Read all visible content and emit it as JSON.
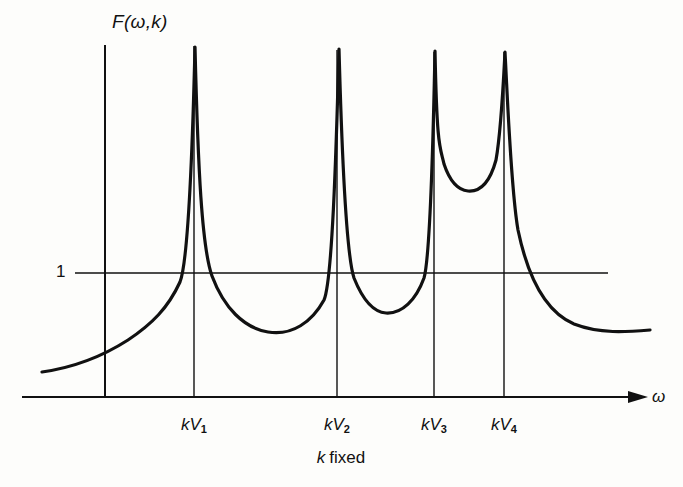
{
  "figure": {
    "y_axis_label": "F(ω,k)",
    "x_axis_label": "ω",
    "reference_label": "1",
    "caption_symbol": "k",
    "caption_text": "fixed",
    "caption_full": "k fixed",
    "ticks": [
      {
        "prefix": "kV",
        "index": "1"
      },
      {
        "prefix": "kV",
        "index": "2"
      },
      {
        "prefix": "kV",
        "index": "3"
      },
      {
        "prefix": "kV",
        "index": "4"
      }
    ],
    "ink_color": "#111111",
    "background_color": "#fdfdfb"
  },
  "chart_data": {
    "type": "line",
    "title": "",
    "subtitle": "k fixed",
    "xlabel": "ω",
    "ylabel": "F(ω,k)",
    "xlim": [
      0,
      683
    ],
    "ylim": [
      0,
      1
    ],
    "grid": false,
    "legend": null,
    "annotations": [
      {
        "text": "1",
        "type": "reference-level",
        "y_value": 1
      },
      {
        "text": "k fixed",
        "type": "caption"
      }
    ],
    "reference_lines": [
      {
        "orientation": "horizontal",
        "label": "1",
        "y_px": 273,
        "x_start_px": 75,
        "x_end_px": 608
      },
      {
        "orientation": "vertical",
        "label": "kV1",
        "x_px": 194,
        "y_top_px": 46,
        "y_bottom_px": 397
      },
      {
        "orientation": "vertical",
        "label": "kV2",
        "x_px": 337,
        "y_top_px": 50,
        "y_bottom_px": 397
      },
      {
        "orientation": "vertical",
        "label": "kV3",
        "x_px": 434,
        "y_top_px": 52,
        "y_bottom_px": 397
      },
      {
        "orientation": "vertical",
        "label": "kV4",
        "x_px": 504,
        "y_top_px": 52,
        "y_bottom_px": 397
      }
    ],
    "resonances": [
      {
        "label": "kV1",
        "x_px": 196,
        "peak_top_px": 46
      },
      {
        "label": "kV2",
        "x_px": 340,
        "peak_top_px": 50
      },
      {
        "label": "kV3",
        "x_px": 436,
        "peak_top_px": 52
      },
      {
        "label": "kV4",
        "x_px": 506,
        "peak_top_px": 52
      }
    ],
    "minima": [
      {
        "between": [
          "kV1",
          "kV2"
        ],
        "x_px": 268,
        "y_px": 332
      },
      {
        "between": [
          "kV2",
          "kV3"
        ],
        "x_px": 386,
        "y_px": 313
      },
      {
        "between": [
          "kV3",
          "kV4"
        ],
        "x_px": 468,
        "y_px": 191
      }
    ],
    "tails": {
      "left_start": {
        "x_px": 42,
        "y_px": 372
      },
      "right_end": {
        "x_px": 650,
        "y_px": 330
      }
    },
    "series": [
      {
        "name": "F(ω,k)",
        "path": "M 42 372 C 70 368 100 358 128 340 C 152 324 168 308 180 282 C 188 262 192 170 195 47 C 198 170 202 248 212 276 C 224 308 244 328 268 332 C 292 336 312 322 324 300 C 332 282 336 160 339 49 C 342 160 346 254 354 278 C 362 298 372 312 386 313 C 402 314 416 300 424 278 C 430 258 433 150 435 51 C 437 150 440 146 444 164 C 450 182 458 190 468 191 C 480 192 490 182 496 160 C 501 132 503 90 505 52 C 508 108 511 190 518 230 C 528 278 546 312 574 324 C 600 334 626 332 650 330"
      }
    ]
  }
}
